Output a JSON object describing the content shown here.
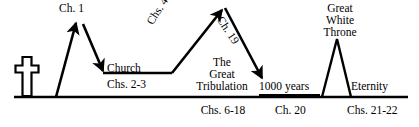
{
  "diagram": {
    "colors": {
      "ink": "#000000",
      "background": "#ffffff"
    },
    "icons": {
      "cross": "cross-icon"
    },
    "labels": {
      "ch1": "Ch. 1",
      "church": "Church",
      "chs_2_3": "Chs. 2-3",
      "chs_4_5": "Chs. 4-5",
      "ch_19": "Ch. 19",
      "tribulation_line1": "The",
      "tribulation_line2": "Great",
      "tribulation_line3": "Tribulation",
      "chs_6_18": "Chs. 6-18",
      "thousand_years": "1000 years",
      "ch_20": "Ch. 20",
      "gwt_line1": "Great",
      "gwt_line2": "White",
      "gwt_line3": "Throne",
      "eternity": "Eternity",
      "chs_21_22": "Chs. 21-22"
    }
  }
}
